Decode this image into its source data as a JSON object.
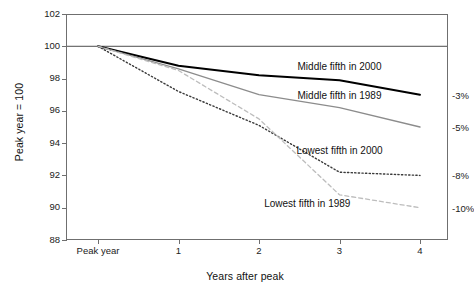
{
  "chart_data": {
    "type": "line",
    "title": "",
    "xlabel": "Years after peak",
    "ylabel": "Peak year = 100",
    "x": [
      "Peak year",
      "1",
      "2",
      "3",
      "4"
    ],
    "xtick_labels": [
      "Peak year",
      "1",
      "2",
      "3",
      "4"
    ],
    "ytick_labels": [
      "102",
      "100",
      "98",
      "96",
      "94",
      "92",
      "90",
      "88"
    ],
    "ylim": [
      88,
      102
    ],
    "grid": false,
    "legend_position": "inline-annotations",
    "series": [
      {
        "name": "Middle fifth in 2000",
        "values": [
          100,
          98.8,
          98.2,
          97.9,
          97.0
        ],
        "end_label": "-3%",
        "style": "solid",
        "color": "#000000",
        "width": 2.0,
        "label_x": 3,
        "label_y": 98.8
      },
      {
        "name": "Middle fifth in 1989",
        "values": [
          100,
          98.6,
          97.0,
          96.2,
          95.0
        ],
        "end_label": "-5%",
        "style": "solid",
        "color": "#8c8c8c",
        "width": 1.3,
        "label_x": 3,
        "label_y": 97.0
      },
      {
        "name": "Lowest fifth in 2000",
        "values": [
          100,
          97.2,
          95.1,
          92.2,
          92.0
        ],
        "end_label": "-8%",
        "style": "dotted",
        "color": "#3a3a3a",
        "width": 1.4,
        "label_x": 3,
        "label_y": 93.6
      },
      {
        "name": "Lowest fifth in 1989",
        "values": [
          100,
          98.5,
          95.5,
          90.8,
          90.0
        ],
        "end_label": "-10%",
        "style": "dashed",
        "color": "#bdbdbd",
        "width": 1.3,
        "label_x": 2.6,
        "label_y": 90.3
      }
    ],
    "baseline": {
      "value": 100,
      "color": "#4d4d4d"
    },
    "frame_color": "#6f6f6f",
    "background": "#ffffff"
  }
}
